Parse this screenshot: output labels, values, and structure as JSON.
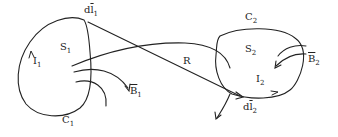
{
  "diagram": {
    "loop1": {
      "curve": "C",
      "curve_sub": "1",
      "surface": "S",
      "surface_sub": "1",
      "current": "I",
      "current_sub": "1",
      "element": "dl",
      "element_prefix": "d",
      "element_symbol": "l",
      "element_sub": "1",
      "field": "B",
      "field_sub": "1"
    },
    "loop2": {
      "curve": "C",
      "curve_sub": "2",
      "surface": "S",
      "surface_sub": "2",
      "current": "I",
      "current_sub": "2",
      "element_prefix": "d",
      "element_symbol": "l",
      "element_sub": "2",
      "field": "B",
      "field_sub": "2"
    },
    "separation": "R",
    "colors": {
      "stroke": "#222222",
      "background": "#ffffff"
    }
  }
}
